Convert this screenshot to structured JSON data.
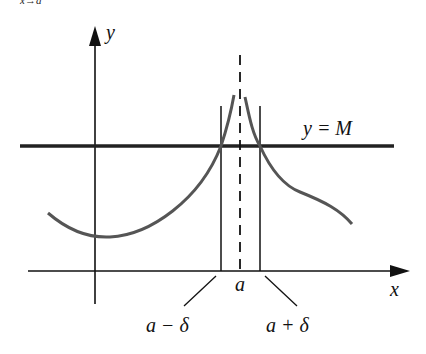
{
  "header_fragment": "x→a",
  "labels": {
    "y_axis": "y",
    "x_axis": "x",
    "line": "y = M",
    "a": "a",
    "a_minus": "a − δ",
    "a_plus": "a + δ"
  },
  "colors": {
    "axis": "#111111",
    "curve": "#555555",
    "line": "#222222"
  }
}
